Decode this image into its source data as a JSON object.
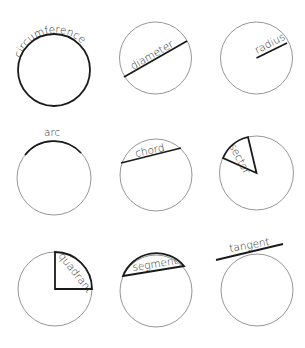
{
  "diagram": {
    "colors": {
      "outline": "#8a8a8a",
      "highlight": "#1a1a1a",
      "text": "#2a2a2a",
      "background": "#ffffff"
    },
    "items": [
      {
        "id": "circumference",
        "label": "circumference",
        "row": 1,
        "col": 1
      },
      {
        "id": "diameter",
        "label": "diameter",
        "row": 1,
        "col": 2
      },
      {
        "id": "radius",
        "label": "radius",
        "row": 1,
        "col": 3
      },
      {
        "id": "arc",
        "label": "arc",
        "row": 2,
        "col": 1
      },
      {
        "id": "chord",
        "label": "chord",
        "row": 2,
        "col": 2
      },
      {
        "id": "sector",
        "label": "sector",
        "row": 2,
        "col": 3
      },
      {
        "id": "quadrant",
        "label": "quadrant",
        "row": 3,
        "col": 1
      },
      {
        "id": "segment",
        "label": "segment",
        "row": 3,
        "col": 2
      },
      {
        "id": "tangent",
        "label": "tangent",
        "row": 3,
        "col": 3
      }
    ]
  }
}
